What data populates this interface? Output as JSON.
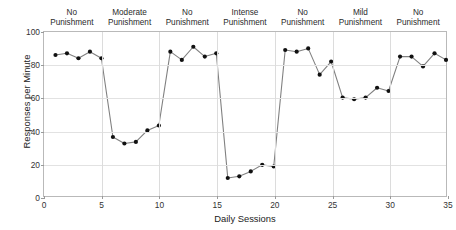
{
  "chart_data": {
    "type": "line",
    "title": "",
    "xlabel": "Daily Sessions",
    "ylabel": "Responses per Minute",
    "xlim": [
      0,
      35
    ],
    "ylim": [
      0,
      100
    ],
    "grid": true,
    "legend": "none",
    "marker": "filled-circle",
    "line_color": "#808080",
    "marker_color": "#111111",
    "xticks": [
      0,
      5,
      10,
      15,
      20,
      25,
      30,
      35
    ],
    "yticks": [
      0,
      20,
      40,
      60,
      80,
      100
    ],
    "x": [
      1,
      2,
      3,
      4,
      5,
      6,
      7,
      8,
      9,
      10,
      11,
      12,
      13,
      14,
      15,
      16,
      17,
      18,
      19,
      20,
      21,
      22,
      23,
      24,
      25,
      26,
      27,
      28,
      29,
      30,
      31,
      32,
      33,
      34,
      35
    ],
    "values": [
      86,
      87,
      84,
      88,
      84,
      36,
      32,
      33,
      40,
      43,
      88,
      83,
      91,
      85,
      87,
      11,
      12,
      15,
      19,
      18,
      89,
      88,
      90,
      74,
      82,
      60,
      59,
      60,
      66,
      64,
      85,
      85,
      79,
      87,
      83
    ],
    "series": [
      {
        "name": "Responses per Minute",
        "values": [
          86,
          87,
          84,
          88,
          84,
          36,
          32,
          33,
          40,
          43,
          88,
          83,
          91,
          85,
          87,
          11,
          12,
          15,
          19,
          18,
          89,
          88,
          90,
          74,
          82,
          60,
          59,
          60,
          66,
          64,
          85,
          85,
          79,
          87,
          83
        ]
      }
    ],
    "phase_dividers": [
      5,
      10,
      15,
      20,
      25,
      30
    ],
    "phases": [
      {
        "label": "No\nPunishment",
        "start": 0,
        "end": 5
      },
      {
        "label": "Moderate\nPunishment",
        "start": 5,
        "end": 10
      },
      {
        "label": "No\nPunishment",
        "start": 10,
        "end": 15
      },
      {
        "label": "Intense\nPunishment",
        "start": 15,
        "end": 20
      },
      {
        "label": "No\nPunishment",
        "start": 20,
        "end": 25
      },
      {
        "label": "Mild\nPunishment",
        "start": 25,
        "end": 30
      },
      {
        "label": "No\nPunishment",
        "start": 30,
        "end": 35
      }
    ]
  }
}
